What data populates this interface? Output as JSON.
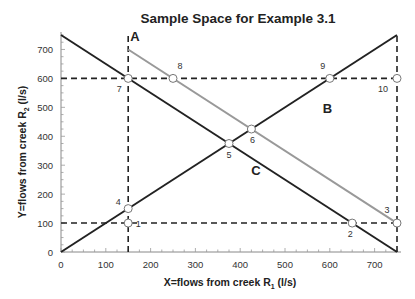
{
  "chart_data": {
    "type": "line",
    "title": "Sample Space for Example 3.1",
    "xlabel": "X=flows from creek R",
    "xlabel_sub": "1",
    "xlabel_unit": " (l/s)",
    "ylabel": "Y=flows from creek R",
    "ylabel_sub": "2",
    "ylabel_unit": " (l/s)",
    "xlim": [
      0,
      750
    ],
    "ylim": [
      0,
      750
    ],
    "xticks": [
      0,
      100,
      200,
      300,
      400,
      500,
      600,
      700
    ],
    "yticks": [
      0,
      100,
      200,
      300,
      400,
      500,
      600,
      700
    ],
    "grid": false,
    "series": [
      {
        "name": "A",
        "color": "#999999",
        "points": [
          [
            150,
            700
          ],
          [
            750,
            100
          ]
        ],
        "label_at": [
          165,
          730
        ]
      },
      {
        "name": "B",
        "color": "#222222",
        "points": [
          [
            0,
            0
          ],
          [
            750,
            750
          ]
        ],
        "label_at": [
          595,
          480
        ]
      },
      {
        "name": "C",
        "color": "#222222",
        "points": [
          [
            0,
            750
          ],
          [
            750,
            0
          ]
        ],
        "label_at": [
          435,
          265
        ]
      }
    ],
    "dashed_lines": [
      {
        "from": [
          0,
          600
        ],
        "to": [
          750,
          600
        ]
      },
      {
        "from": [
          0,
          100
        ],
        "to": [
          750,
          100
        ]
      },
      {
        "from": [
          150,
          0
        ],
        "to": [
          150,
          750
        ]
      },
      {
        "from": [
          750,
          0
        ],
        "to": [
          750,
          750
        ]
      }
    ],
    "sample_points": [
      {
        "id": "1",
        "x": 150,
        "y": 100,
        "label_dx": 10,
        "label_dy": 4
      },
      {
        "id": "2",
        "x": 650,
        "y": 100,
        "label_dx": -2,
        "label_dy": 14
      },
      {
        "id": "3",
        "x": 750,
        "y": 100,
        "label_dx": -10,
        "label_dy": -10
      },
      {
        "id": "4",
        "x": 150,
        "y": 150,
        "label_dx": -10,
        "label_dy": -4
      },
      {
        "id": "5",
        "x": 375,
        "y": 375,
        "label_dx": 0,
        "label_dy": 14
      },
      {
        "id": "6",
        "x": 425,
        "y": 425,
        "label_dx": 1,
        "label_dy": 14
      },
      {
        "id": "7",
        "x": 150,
        "y": 600,
        "label_dx": -9,
        "label_dy": 14
      },
      {
        "id": "8",
        "x": 250,
        "y": 600,
        "label_dx": 7,
        "label_dy": -9
      },
      {
        "id": "9",
        "x": 600,
        "y": 600,
        "label_dx": -7,
        "label_dy": -9
      },
      {
        "id": "10",
        "x": 750,
        "y": 600,
        "label_dx": -14,
        "label_dy": 14
      }
    ]
  }
}
